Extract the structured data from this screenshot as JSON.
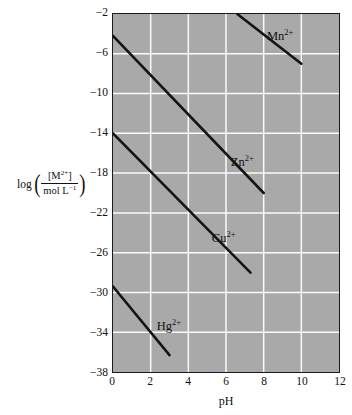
{
  "chart_data": {
    "type": "line",
    "title": "",
    "subtitle": "",
    "xlabel": "pH",
    "ylabel": "log ( [M2+] / mol L-1 )",
    "ylabel_parts": {
      "operator": "log",
      "numerator": "[M",
      "numerator_sup": "2+",
      "numerator_tail": "]",
      "denominator": "mol L",
      "denominator_sup": "−1",
      "open_paren": "(",
      "close_paren": ")"
    },
    "xlim": [
      0,
      12
    ],
    "ylim": [
      -38,
      -2
    ],
    "xticks": [
      0,
      2,
      4,
      6,
      8,
      10,
      12
    ],
    "xtick_labels": [
      "0",
      "2",
      "4",
      "6",
      "8",
      "10",
      "12"
    ],
    "yticks": [
      -2,
      -6,
      -10,
      -14,
      -18,
      -22,
      -26,
      -30,
      -34,
      -38
    ],
    "ytick_labels": [
      "−2",
      "−6",
      "−10",
      "−14",
      "−18",
      "−22",
      "−26",
      "−30",
      "−34",
      "−38"
    ],
    "grid": true,
    "grid_color": "#fbfbfb",
    "plot_background": "#a9a9a9",
    "line_color": "#141414",
    "legend_position": "inline-labels",
    "series": [
      {
        "name": "Mn2+",
        "label_html": "Mn<sup>2+</sup>",
        "label_x": 8.1,
        "label_y": -3.6,
        "x": [
          6.6,
          10.0
        ],
        "y": [
          -2.0,
          -7.0
        ]
      },
      {
        "name": "Zn2+",
        "label_html": "Zn<sup>2+</sup>",
        "label_y": -16.2,
        "label_x": 6.2,
        "x": [
          0.0,
          8.0
        ],
        "y": [
          -4.2,
          -20.0
        ]
      },
      {
        "name": "Cu2+",
        "label_html": "Cu<sup>2+</sup>",
        "label_x": 5.2,
        "label_y": -23.8,
        "x": [
          0.0,
          7.3
        ],
        "y": [
          -14.0,
          -28.0
        ]
      },
      {
        "name": "Hg2+",
        "label_html": "Hg<sup>2+</sup>",
        "label_x": 2.3,
        "label_y": -32.6,
        "x": [
          0.0,
          3.0
        ],
        "y": [
          -29.4,
          -36.3
        ]
      }
    ]
  }
}
